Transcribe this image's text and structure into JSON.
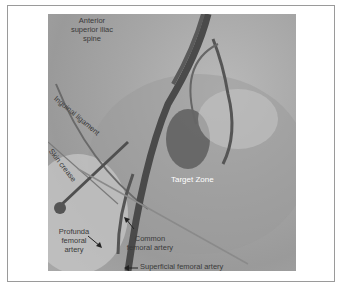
{
  "figure": {
    "type": "fluoroscopy-image-annotated",
    "labels": {
      "asis": "Anterior\nsuperior iliac\nspine",
      "inguinal_ligament": "Inguinal ligament",
      "skin_crease": "Skin crease",
      "target_zone": "Target Zone",
      "profunda": "Profunda\nfemoral\nartery",
      "common_femoral": "Common\nfemoral artery",
      "superficial_femoral": "Superficial femoral artery"
    },
    "colors": {
      "background": "#ffffff",
      "border": "#9a9a9a",
      "image_gray": "#a6a6a6",
      "vessel": "#4a4a4a",
      "label_dark": "#3a3a3a",
      "label_light": "#ffffff"
    }
  }
}
